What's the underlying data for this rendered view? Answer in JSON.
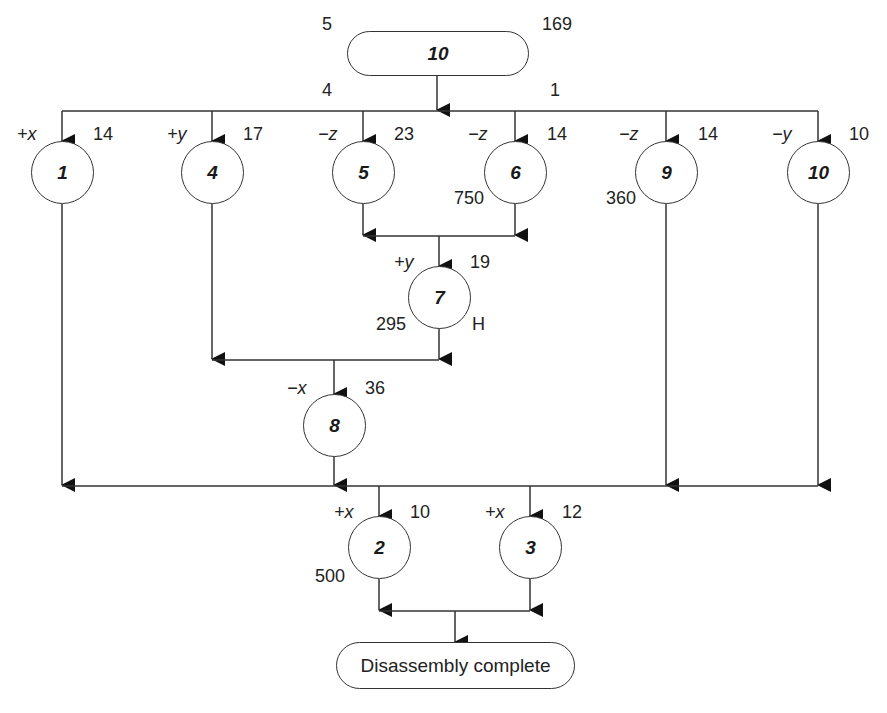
{
  "diagram": {
    "type": "disassembly-precedence-diagram",
    "start_node": {
      "label": "10",
      "top_left": "5",
      "top_right": "169",
      "bottom_left": "4",
      "bottom_right": "1"
    },
    "nodes": [
      {
        "id": "1",
        "direction": "+x",
        "value": "14",
        "extra": ""
      },
      {
        "id": "4",
        "direction": "+y",
        "value": "17",
        "extra": ""
      },
      {
        "id": "5",
        "direction": "−z",
        "value": "23",
        "extra": ""
      },
      {
        "id": "6",
        "direction": "−z",
        "value": "14",
        "extra": "750"
      },
      {
        "id": "9",
        "direction": "−z",
        "value": "14",
        "extra": "360"
      },
      {
        "id": "10",
        "direction": "−y",
        "value": "10",
        "extra": ""
      },
      {
        "id": "7",
        "direction": "+y",
        "value": "19",
        "extra": "295",
        "extra_right": "H"
      },
      {
        "id": "8",
        "direction": "−x",
        "value": "36",
        "extra": ""
      },
      {
        "id": "2",
        "direction": "+x",
        "value": "10",
        "extra": "500"
      },
      {
        "id": "3",
        "direction": "+x",
        "value": "12",
        "extra": ""
      }
    ],
    "end_node": {
      "label": "Disassembly complete"
    },
    "edges": [
      [
        "start",
        "1"
      ],
      [
        "start",
        "4"
      ],
      [
        "start",
        "5"
      ],
      [
        "start",
        "6"
      ],
      [
        "start",
        "9"
      ],
      [
        "start",
        "10"
      ],
      [
        "5",
        "7"
      ],
      [
        "6",
        "7"
      ],
      [
        "4",
        "8"
      ],
      [
        "7",
        "8"
      ],
      [
        "1",
        "2"
      ],
      [
        "8",
        "2"
      ],
      [
        "9",
        "2"
      ],
      [
        "10",
        "2"
      ],
      [
        "1",
        "3"
      ],
      [
        "8",
        "3"
      ],
      [
        "9",
        "3"
      ],
      [
        "10",
        "3"
      ],
      [
        "2",
        "end"
      ],
      [
        "3",
        "end"
      ]
    ]
  }
}
